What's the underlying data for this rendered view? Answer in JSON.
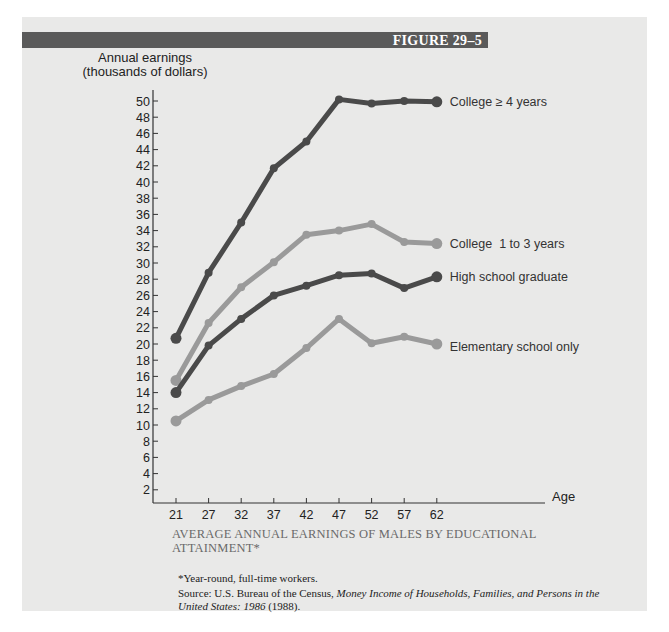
{
  "figure": {
    "label": "FIGURE 29–5",
    "caption": "AVERAGE ANNUAL EARNINGS OF MALES BY EDUCATIONAL ATTAINMENT*",
    "note": "*Year-round, full-time workers.",
    "source_prefix": "Source: U.S. Bureau of the Census, ",
    "source_title": "Money Income of Households, Families, and Persons in the United States: 1986",
    "source_suffix": " (1988)."
  },
  "axes": {
    "ylabel_line1": "Annual earnings",
    "ylabel_line2": "(thousands of dollars)",
    "xlabel": "Age"
  },
  "colors": {
    "panel": "#e9e9e8",
    "bar": "#5a5a5a",
    "dark_series": "#4a4a4a",
    "light_series": "#9a9a9a",
    "axis": "#333333"
  },
  "chart_data": {
    "type": "line",
    "title": "Average Annual Earnings of Males by Educational Attainment",
    "xlabel": "Age",
    "ylabel": "Annual earnings (thousands of dollars)",
    "x": [
      21,
      27,
      32,
      37,
      42,
      47,
      52,
      57,
      62
    ],
    "yticks": [
      2,
      4,
      6,
      8,
      10,
      12,
      14,
      16,
      18,
      20,
      22,
      24,
      26,
      28,
      30,
      32,
      34,
      36,
      38,
      40,
      42,
      44,
      46,
      48,
      50
    ],
    "ylim": [
      0,
      52
    ],
    "grid": false,
    "legend_position": "inline-right",
    "series": [
      {
        "name": "College ≥ 4 years",
        "shade": "dark",
        "values": [
          20.7,
          28.8,
          35.0,
          41.7,
          45.0,
          50.2,
          49.7,
          50.0,
          49.9
        ]
      },
      {
        "name": "College  1 to 3 years",
        "shade": "light",
        "values": [
          15.5,
          22.6,
          27.0,
          30.1,
          33.5,
          34.0,
          34.8,
          32.6,
          32.4
        ]
      },
      {
        "name": "High school graduate",
        "shade": "dark",
        "values": [
          14.0,
          19.8,
          23.1,
          26.0,
          27.2,
          28.5,
          28.7,
          26.9,
          28.3
        ]
      },
      {
        "name": "Elementary school only",
        "shade": "light",
        "values": [
          10.5,
          13.1,
          14.8,
          16.3,
          19.5,
          23.1,
          20.1,
          20.9,
          20.0
        ]
      }
    ]
  }
}
